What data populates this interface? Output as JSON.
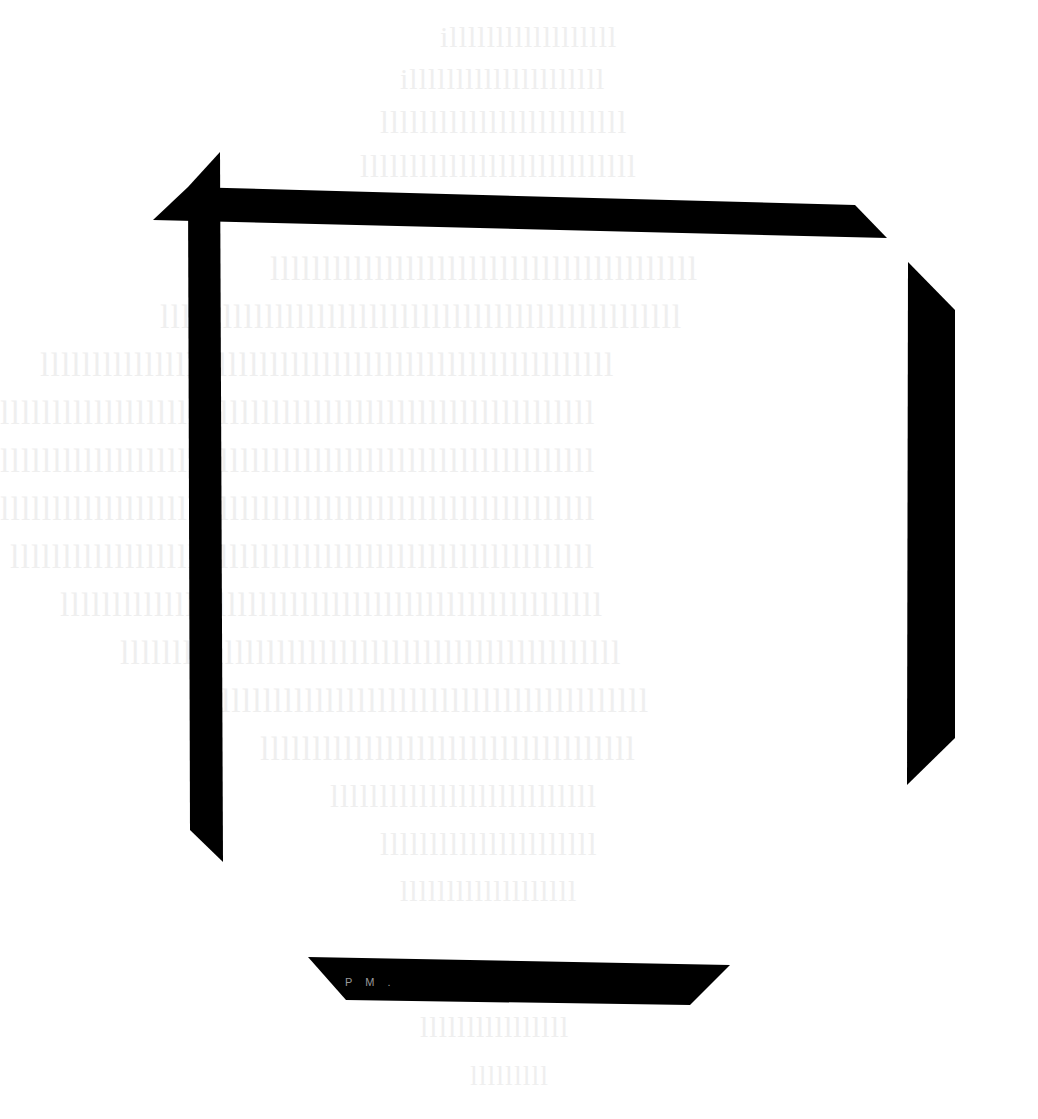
{
  "scan": {
    "background": "#ffffff",
    "bar_color": "#000000",
    "bleed_text_color": "#efefef",
    "bottom_bar_mark": "P M ."
  },
  "bleed_lines": [
    {
      "text": "illllllllllllllllll",
      "x": 440,
      "y": 20,
      "size": 30
    },
    {
      "text": "illlllllllllllllllllll",
      "x": 400,
      "y": 62,
      "size": 30
    },
    {
      "text": "lllllllllllllllllllllllll",
      "x": 380,
      "y": 104,
      "size": 32
    },
    {
      "text": "llllllllllllllllllllllllllll",
      "x": 360,
      "y": 148,
      "size": 32
    },
    {
      "text": "lllllllllllllllllllllllllllllllllllllllll",
      "x": 270,
      "y": 250,
      "size": 34
    },
    {
      "text": "llllllllllllllllllllllllllllllllllllllllllllllllll",
      "x": 160,
      "y": 298,
      "size": 34
    },
    {
      "text": "lllllllllllllllllllllllllllllllllllllllllllllllllllllll",
      "x": 40,
      "y": 346,
      "size": 34
    },
    {
      "text": "lllllllllllllllllllllllllllllllllllllllllllllllllllllllll",
      "x": 0,
      "y": 394,
      "size": 34
    },
    {
      "text": "lllllllllllllllllllllllllllllllllllllllllllllllllllllllll",
      "x": 0,
      "y": 442,
      "size": 34
    },
    {
      "text": "lllllllllllllllllllllllllllllllllllllllllllllllllllllllll",
      "x": 0,
      "y": 490,
      "size": 34
    },
    {
      "text": "llllllllllllllllllllllllllllllllllllllllllllllllllllllll",
      "x": 10,
      "y": 538,
      "size": 34
    },
    {
      "text": "llllllllllllllllllllllllllllllllllllllllllllllllllll",
      "x": 60,
      "y": 586,
      "size": 34
    },
    {
      "text": "llllllllllllllllllllllllllllllllllllllllllllllll",
      "x": 120,
      "y": 634,
      "size": 34
    },
    {
      "text": "lllllllllllllllllllllllllllllllllllllllllll",
      "x": 200,
      "y": 682,
      "size": 34
    },
    {
      "text": "llllllllllllllllllllllllllllllllllll",
      "x": 260,
      "y": 730,
      "size": 34
    },
    {
      "text": "lllllllllllllllllllllllllll",
      "x": 330,
      "y": 778,
      "size": 32
    },
    {
      "text": "llllllllllllllllllllll",
      "x": 380,
      "y": 826,
      "size": 32
    },
    {
      "text": "lllllllllllllllllll",
      "x": 400,
      "y": 874,
      "size": 30
    },
    {
      "text": "llllllllllllllll",
      "x": 420,
      "y": 1010,
      "size": 30
    },
    {
      "text": "lllllllll",
      "x": 470,
      "y": 1060,
      "size": 28
    }
  ]
}
